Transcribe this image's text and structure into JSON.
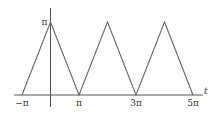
{
  "chart_data": {
    "type": "line",
    "title": "",
    "xlabel": "t",
    "ylabel": "",
    "x_unit": "pi",
    "xlim": [
      -1,
      5
    ],
    "ylim": [
      0,
      1
    ],
    "grid": false,
    "legend": "none",
    "series": [
      {
        "name": "triangle wave",
        "x": [
          -1,
          0,
          1,
          2,
          3,
          4,
          5
        ],
        "y": [
          0,
          1,
          0,
          1,
          0,
          1,
          0
        ],
        "color": "#666666"
      }
    ],
    "x_ticks": [
      {
        "value": -1,
        "label": "−π"
      },
      {
        "value": 1,
        "label": "π"
      },
      {
        "value": 3,
        "label": "3π"
      },
      {
        "value": 5,
        "label": "5π"
      }
    ],
    "y_ticks": [
      {
        "value": 1,
        "label": "π"
      }
    ]
  }
}
